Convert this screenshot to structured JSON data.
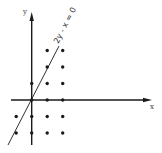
{
  "diagram": {
    "type": "lattice-points-with-line",
    "origin_px": [
      31.7,
      100
    ],
    "unit_px": {
      "x": 15.5,
      "y": 16.5
    },
    "x_axis": {
      "label": "x",
      "from_px": 11,
      "to_px": 152
    },
    "y_axis": {
      "label": "y",
      "from_px": 145,
      "to_px": 12
    },
    "line": {
      "label": "2y - x = 0",
      "from_px": [
        8,
        145
      ],
      "to_px": [
        59,
        46
      ]
    },
    "points": [
      [
        1,
        3
      ],
      [
        2,
        3
      ],
      [
        1,
        2
      ],
      [
        2,
        2
      ],
      [
        0,
        1
      ],
      [
        1,
        1
      ],
      [
        2,
        1
      ],
      [
        0,
        0
      ],
      [
        1,
        0
      ],
      [
        2,
        0
      ],
      [
        -1,
        -1
      ],
      [
        0,
        -1
      ],
      [
        1,
        -1
      ],
      [
        2,
        -1
      ],
      [
        -1,
        -2
      ],
      [
        0,
        -2
      ],
      [
        1,
        -2
      ],
      [
        2,
        -2
      ]
    ],
    "colors": {
      "ink": "#1a1a1a",
      "background": "#ffffff"
    }
  }
}
